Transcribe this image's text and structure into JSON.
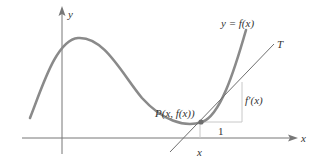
{
  "diagram": {
    "axes": {
      "x_label": "x",
      "y_label": "y"
    },
    "curve": {
      "label": "y = f(x)",
      "color": "#8a8a8a"
    },
    "tangent": {
      "label": "T",
      "color": "#6e6e6e"
    },
    "point": {
      "label": "P(x, f(x))"
    },
    "slope_triangle": {
      "run_label": "1",
      "rise_label": "f′(x)",
      "color": "#bdbdbd"
    },
    "x_tick_label": "x"
  }
}
